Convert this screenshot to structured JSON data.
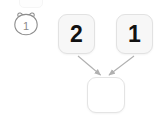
{
  "diagram": {
    "type": "tree-merge",
    "background_color": "#ffffff",
    "node_fill": "#f7f7f7",
    "node_border": "#e2e2e2",
    "edge_color": "#b0b0b0",
    "badge": {
      "icon": "bear-head-icon",
      "label": "1",
      "color": "#8a8a8a"
    },
    "ghost_node": {
      "icon": "clipped-node-icon",
      "label": ""
    },
    "nodes": [
      {
        "id": "parent-left",
        "label": "2",
        "role": "parent"
      },
      {
        "id": "parent-right",
        "label": "1",
        "role": "parent"
      },
      {
        "id": "child",
        "label": "",
        "role": "child"
      }
    ],
    "edges": [
      {
        "from": "parent-left",
        "to": "child",
        "arrow": "true"
      },
      {
        "from": "parent-right",
        "to": "child",
        "arrow": "true"
      }
    ]
  }
}
